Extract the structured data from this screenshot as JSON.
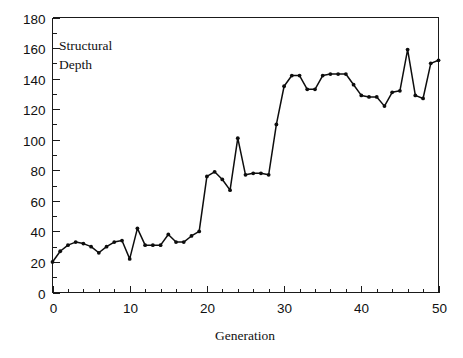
{
  "chart_data": {
    "type": "line",
    "title": "",
    "series_label": "Structural\nDepth",
    "series_label_line1": "Structural",
    "series_label_line2": "Depth",
    "xlabel": "Generation",
    "ylabel": "",
    "xlim": [
      0,
      50
    ],
    "ylim": [
      0,
      180
    ],
    "xticks": [
      0,
      10,
      20,
      30,
      40,
      50
    ],
    "xtick_labels": [
      "0",
      "10",
      "20",
      "30",
      "40",
      "50"
    ],
    "xtick_minor_step": 2,
    "yticks": [
      0,
      20,
      40,
      60,
      80,
      100,
      120,
      140,
      160,
      180
    ],
    "ytick_labels": [
      "0",
      "20",
      "40",
      "60",
      "80",
      "100",
      "120",
      "140",
      "160",
      "180"
    ],
    "ytick_minor_step": 10,
    "grid": false,
    "legend": false,
    "marker": "filled-circle",
    "line_color": "#0d0d0d",
    "axis_color": "#1a1a1a",
    "background_color": "#ffffff",
    "x": [
      0,
      1,
      2,
      3,
      4,
      5,
      6,
      7,
      8,
      9,
      10,
      11,
      12,
      13,
      14,
      15,
      16,
      17,
      18,
      19,
      20,
      21,
      22,
      23,
      24,
      25,
      26,
      27,
      28,
      29,
      30,
      31,
      32,
      33,
      34,
      35,
      36,
      37,
      38,
      39,
      40,
      41,
      42,
      43,
      44,
      45,
      46,
      47,
      48,
      49,
      50
    ],
    "values": [
      20,
      27,
      31,
      33,
      32,
      30,
      26,
      30,
      33,
      34,
      22,
      42,
      31,
      31,
      31,
      38,
      33,
      33,
      37,
      40,
      76,
      79,
      74,
      67,
      101,
      77,
      78,
      78,
      77,
      110,
      135,
      142,
      142,
      133,
      133,
      142,
      143,
      143,
      143,
      136,
      129,
      128,
      128,
      122,
      131,
      132,
      159,
      129,
      127,
      150,
      152
    ]
  },
  "axis": {
    "x_label": "Generation",
    "y_label": ""
  }
}
